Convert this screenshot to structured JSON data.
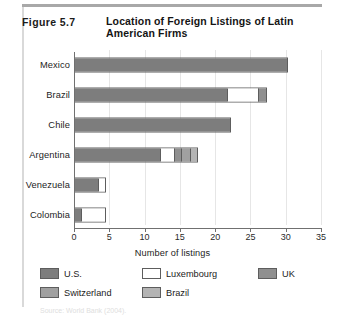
{
  "figure": {
    "number": "Figure 5.7",
    "title": "Location of Foreign Listings of Latin American Firms"
  },
  "source_note": "Source: World Bank (2004).",
  "colors": {
    "us": "#7d7d7d",
    "luxembourg": "#ffffff",
    "uk": "#8f8f8f",
    "switzerland": "#a0a0a0",
    "brazil": "#b4b4b4",
    "axis": "#707070",
    "grid": "#e6e6e6",
    "text": "#1d1d1d",
    "rule": "#a8a8a8"
  },
  "chart_data": {
    "type": "bar",
    "orientation": "horizontal",
    "stacked": true,
    "title": "Location of Foreign Listings of Latin American Firms",
    "xlabel": "Number of listings",
    "ylabel": "",
    "xlim": [
      0,
      35
    ],
    "xticks": [
      "0",
      "5",
      "10",
      "15",
      "20",
      "25",
      "30",
      "35"
    ],
    "xtick_values": [
      0,
      5,
      10,
      15,
      20,
      25,
      30,
      35
    ],
    "grid": true,
    "grid_axis": "x",
    "legend_position": "bottom",
    "categories": [
      "Mexico",
      "Brazil",
      "Chile",
      "Argentina",
      "Venezuela",
      "Colombia"
    ],
    "series": [
      {
        "name": "U.S.",
        "color_key": "us",
        "values": [
          30,
          21.5,
          22,
          12,
          3.3,
          0.9
        ]
      },
      {
        "name": "Luxembourg",
        "color_key": "luxembourg",
        "values": [
          0,
          4.5,
          0,
          2,
          1.0,
          3.4
        ]
      },
      {
        "name": "UK",
        "color_key": "uk",
        "values": [
          0,
          1.0,
          0,
          1.0,
          0,
          0
        ]
      },
      {
        "name": "Switzerland",
        "color_key": "switzerland",
        "values": [
          0,
          0,
          0,
          1.3,
          0,
          0
        ]
      },
      {
        "name": "Brazil",
        "color_key": "brazil",
        "values": [
          0,
          0,
          0,
          1.0,
          0,
          0
        ]
      }
    ],
    "totals": [
      30,
      27,
      22,
      17.3,
      4.3,
      4.3
    ]
  },
  "legend": [
    {
      "label": "U.S.",
      "color_key": "us"
    },
    {
      "label": "Luxembourg",
      "color_key": "luxembourg"
    },
    {
      "label": "UK",
      "color_key": "uk"
    },
    {
      "label": "Switzerland",
      "color_key": "switzerland"
    },
    {
      "label": "Brazil",
      "color_key": "brazil"
    }
  ]
}
